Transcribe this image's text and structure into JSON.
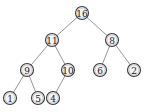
{
  "diagram": {
    "type": "binary-tree",
    "node_radius": 6.5,
    "colors": {
      "edge": "#8a8a8a",
      "node_stroke": "#3a3a3a",
      "node_fill": "#f4f4f4",
      "label": "#222222"
    },
    "nodes": [
      {
        "id": "n16",
        "label": "16",
        "x": 82,
        "y": 13
      },
      {
        "id": "n11",
        "label": "11",
        "x": 52,
        "y": 40
      },
      {
        "id": "n8",
        "label": "8",
        "x": 112,
        "y": 40
      },
      {
        "id": "n9",
        "label": "9",
        "x": 27,
        "y": 70
      },
      {
        "id": "n10",
        "label": "10",
        "x": 68,
        "y": 70
      },
      {
        "id": "n6",
        "label": "6",
        "x": 100,
        "y": 70
      },
      {
        "id": "n2",
        "label": "2",
        "x": 134,
        "y": 70
      },
      {
        "id": "n1",
        "label": "1",
        "x": 10,
        "y": 98
      },
      {
        "id": "n5",
        "label": "5",
        "x": 38,
        "y": 98
      },
      {
        "id": "n4",
        "label": "4",
        "x": 53,
        "y": 98
      }
    ],
    "edges": [
      {
        "from": "n16",
        "to": "n11"
      },
      {
        "from": "n16",
        "to": "n8"
      },
      {
        "from": "n11",
        "to": "n9"
      },
      {
        "from": "n11",
        "to": "n10"
      },
      {
        "from": "n8",
        "to": "n6"
      },
      {
        "from": "n8",
        "to": "n2"
      },
      {
        "from": "n9",
        "to": "n1"
      },
      {
        "from": "n9",
        "to": "n5"
      },
      {
        "from": "n10",
        "to": "n4"
      }
    ]
  }
}
